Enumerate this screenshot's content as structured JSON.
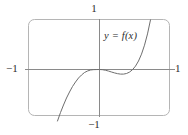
{
  "figure": {
    "kind": "calculator-viewing-window",
    "background_color": "#ffffff",
    "frame": {
      "stroke_color": "#b0b0b0",
      "corner_radius": 6,
      "x": 28,
      "y": 19,
      "width": 142,
      "height": 97
    },
    "axes": {
      "stroke_color": "#8a8a8a",
      "origin_x": 99,
      "origin_y": 69,
      "x_axis_start": 25,
      "x_axis_end": 175,
      "y_axis_start": 19,
      "y_axis_end": 117
    },
    "labels": {
      "top": "1",
      "bottom": "−1",
      "left": "−1",
      "right": "1"
    },
    "function_label": "y = f(x)"
  },
  "chart_data": {
    "type": "line",
    "title": "",
    "subtitle": "",
    "xlabel": "",
    "ylabel": "",
    "xlim": [
      -1,
      1
    ],
    "ylim": [
      -1,
      1
    ],
    "xticks": [
      -1,
      1
    ],
    "yticks": [
      -1,
      1
    ],
    "xticklabels": [
      "−1",
      "1"
    ],
    "yticklabels": [
      "−1",
      "1"
    ],
    "grid": false,
    "legend": false,
    "annotations": [
      {
        "text": "y = f(x)",
        "x": 0.1,
        "y": 0.68,
        "style": "italic"
      }
    ],
    "series": [
      {
        "name": "y = f(x)",
        "color": "#6e6e6e",
        "linewidth": 1,
        "description": "Cubic-like curve rising from below the window at the lower left, flattening with an inflection at the origin, dipping slightly below the x-axis, then rising steeply off the top of the window on the right.",
        "x": [
          -0.56,
          -0.52,
          -0.48,
          -0.44,
          -0.4,
          -0.36,
          -0.32,
          -0.28,
          -0.24,
          -0.2,
          -0.16,
          -0.12,
          -0.08,
          -0.04,
          0.0,
          0.04,
          0.08,
          0.12,
          0.16,
          0.2,
          0.24,
          0.28,
          0.32,
          0.36,
          0.4,
          0.44,
          0.48,
          0.52,
          0.56,
          0.6,
          0.64,
          0.68
        ],
        "y": [
          -1.03,
          -0.86,
          -0.71,
          -0.57,
          -0.45,
          -0.34,
          -0.25,
          -0.17,
          -0.11,
          -0.06,
          -0.03,
          -0.01,
          -0.003,
          -0.001,
          0.0,
          -0.004,
          -0.015,
          -0.031,
          -0.05,
          -0.068,
          -0.083,
          -0.092,
          -0.092,
          -0.08,
          -0.052,
          -0.004,
          0.068,
          0.17,
          0.307,
          0.486,
          0.712,
          0.993
        ]
      }
    ]
  }
}
